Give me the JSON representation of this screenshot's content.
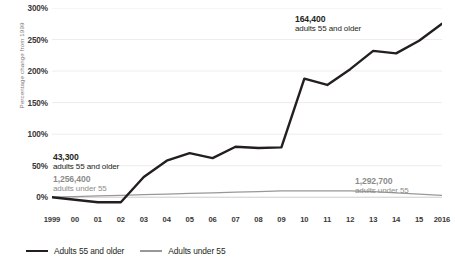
{
  "chart_data": {
    "type": "line",
    "title": "",
    "xlabel": "",
    "ylabel": "Percentage change from 1999",
    "ylim": [
      -25,
      300
    ],
    "yticks": [
      0,
      50,
      100,
      150,
      200,
      250,
      300
    ],
    "ytick_labels": [
      "0%",
      "50%",
      "100%",
      "150%",
      "200%",
      "250%",
      "300%"
    ],
    "grid": true,
    "legend_position": "bottom-left",
    "categories": [
      "1999",
      "00",
      "01",
      "02",
      "03",
      "04",
      "05",
      "06",
      "07",
      "08",
      "09",
      "10",
      "11",
      "12",
      "13",
      "14",
      "15",
      "2016"
    ],
    "x": [
      1999,
      2000,
      2001,
      2002,
      2003,
      2004,
      2005,
      2006,
      2007,
      2008,
      2009,
      2010,
      2011,
      2012,
      2013,
      2014,
      2015,
      2016
    ],
    "series": [
      {
        "name": "Adults 55 and older",
        "color": "#231f20",
        "values": [
          0,
          -4,
          -8,
          -8,
          32,
          58,
          70,
          62,
          80,
          78,
          79,
          188,
          178,
          203,
          232,
          228,
          248,
          275
        ]
      },
      {
        "name": "Adults under 55",
        "color": "#9a9896",
        "values": [
          0,
          1,
          2,
          3,
          4,
          5,
          6,
          7,
          8,
          9,
          10,
          10,
          10,
          10,
          9,
          7,
          5,
          3
        ]
      }
    ],
    "annotations": [
      {
        "id": "left-dark",
        "value": "43,300",
        "label": "adults 55 and older",
        "style": "dark"
      },
      {
        "id": "left-gray",
        "value": "1,256,400",
        "label": "adults under 55",
        "style": "gray"
      },
      {
        "id": "right-dark",
        "value": "164,400",
        "label": "adults 55 and older",
        "style": "dark"
      },
      {
        "id": "right-gray",
        "value": "1,292,700",
        "label": "adults under 55",
        "style": "gray"
      }
    ]
  },
  "legend": {
    "items": [
      {
        "label": "Adults 55 and older"
      },
      {
        "label": "Adults under 55"
      }
    ]
  }
}
